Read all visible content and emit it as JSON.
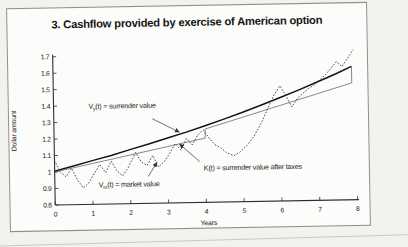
{
  "figure": {
    "title": "3. Cashflow provided by exercise of American option"
  },
  "chart_data": {
    "type": "line",
    "title": "3. Cashflow provided by exercise of American option",
    "xlabel": "Years",
    "ylabel": "Dollar amount",
    "xlim": [
      0,
      8
    ],
    "ylim": [
      0.8,
      1.7
    ],
    "x_ticks": [
      0,
      1,
      2,
      3,
      4,
      5,
      6,
      7,
      8
    ],
    "y_ticks": [
      0.8,
      0.9,
      1.0,
      1.1,
      1.2,
      1.3,
      1.4,
      1.5,
      1.6,
      1.7
    ],
    "grid": false,
    "legend_position": "none (labels are inline annotations with arrows)",
    "series": [
      {
        "name": "surrender-value",
        "label": "Vy(t) = surrender value",
        "style": "solid-thick",
        "points": [
          [
            0,
            1.005
          ],
          [
            0.5,
            1.035
          ],
          [
            1,
            1.065
          ],
          [
            1.5,
            1.095
          ],
          [
            2,
            1.128
          ],
          [
            2.5,
            1.16
          ],
          [
            3,
            1.195
          ],
          [
            3.5,
            1.228
          ],
          [
            4,
            1.265
          ],
          [
            4.5,
            1.303
          ],
          [
            5,
            1.343
          ],
          [
            5.5,
            1.385
          ],
          [
            6,
            1.428
          ],
          [
            6.5,
            1.473
          ],
          [
            7,
            1.52
          ],
          [
            7.5,
            1.568
          ],
          [
            7.9,
            1.61
          ]
        ]
      },
      {
        "name": "surrender-value-after-taxes",
        "label": "K(t) = surrender value after taxes",
        "style": "solid-thin",
        "points": [
          [
            0,
            1.0
          ],
          [
            4,
            1.19
          ],
          [
            4,
            1.245
          ],
          [
            7.9,
            1.51
          ]
        ]
      },
      {
        "name": "market-value",
        "label": "Vm(t) = market value",
        "style": "dotted",
        "points": [
          [
            0,
            1.07
          ],
          [
            0.15,
            1.0
          ],
          [
            0.3,
            0.97
          ],
          [
            0.45,
            1.02
          ],
          [
            0.6,
            0.95
          ],
          [
            0.75,
            0.9
          ],
          [
            0.9,
            0.93
          ],
          [
            1.05,
            0.99
          ],
          [
            1.2,
            1.04
          ],
          [
            1.35,
            0.99
          ],
          [
            1.5,
            1.06
          ],
          [
            1.65,
            1.0
          ],
          [
            1.8,
            0.97
          ],
          [
            1.95,
            1.02
          ],
          [
            2.15,
            1.11
          ],
          [
            2.3,
            1.05
          ],
          [
            2.45,
            1.03
          ],
          [
            2.6,
            1.09
          ],
          [
            2.75,
            1.02
          ],
          [
            2.9,
            1.05
          ],
          [
            3.05,
            1.1
          ],
          [
            3.2,
            1.16
          ],
          [
            3.35,
            1.12
          ],
          [
            3.5,
            1.19
          ],
          [
            3.65,
            1.15
          ],
          [
            3.8,
            1.21
          ],
          [
            3.95,
            1.24
          ],
          [
            4.1,
            1.19
          ],
          [
            4.25,
            1.15
          ],
          [
            4.4,
            1.13
          ],
          [
            4.55,
            1.1
          ],
          [
            4.75,
            1.08
          ],
          [
            4.9,
            1.1
          ],
          [
            5.1,
            1.14
          ],
          [
            5.3,
            1.2
          ],
          [
            5.5,
            1.28
          ],
          [
            5.7,
            1.38
          ],
          [
            5.85,
            1.45
          ],
          [
            6.0,
            1.5
          ],
          [
            6.15,
            1.44
          ],
          [
            6.3,
            1.37
          ],
          [
            6.45,
            1.42
          ],
          [
            6.6,
            1.45
          ],
          [
            6.75,
            1.48
          ],
          [
            6.9,
            1.5
          ],
          [
            7.05,
            1.53
          ],
          [
            7.2,
            1.56
          ],
          [
            7.35,
            1.6
          ],
          [
            7.5,
            1.64
          ],
          [
            7.65,
            1.61
          ],
          [
            7.8,
            1.66
          ],
          [
            7.95,
            1.71
          ]
        ]
      }
    ],
    "closing_segment": {
      "x": 7.9,
      "y_from": 1.51,
      "y_to": 1.61
    },
    "annotations": [
      {
        "pre": "V",
        "sub": "y",
        "post": "(t) = surrender value",
        "text": "Vy(t) = surrender value",
        "x": 80,
        "y": 75,
        "arrow": [
          144,
          86,
          171,
          100
        ]
      },
      {
        "pre": "K",
        "sub": "",
        "post": "(t) = surrender value after taxes",
        "text": "K(t) = surrender value after taxes",
        "x": 195,
        "y": 139,
        "arrow": [
          191,
          130,
          171,
          112
        ]
      },
      {
        "pre": "V",
        "sub": "m",
        "post": "(t) = market value",
        "text": "Vm(t) = market value",
        "x": 89,
        "y": 154,
        "arrow": [
          139,
          144,
          148,
          130
        ]
      }
    ]
  }
}
